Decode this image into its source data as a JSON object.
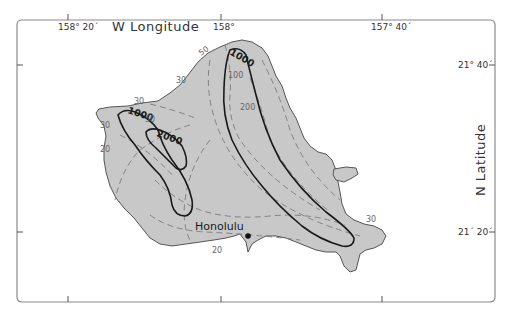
{
  "map": {
    "title_axis_top": "W  Longitude",
    "title_axis_right": "N  Latitude",
    "colors": {
      "land": "#c8c8c8",
      "coastline": "#555555",
      "frame": "#8a8a8a",
      "major_contour": "#1a1a1a",
      "minor_contour": "#7a7a7a"
    },
    "longitude_ticks": [
      {
        "label": "158° 20´"
      },
      {
        "label": "158°"
      },
      {
        "label": "157° 40´"
      }
    ],
    "latitude_ticks": [
      {
        "label": "21° 40´"
      },
      {
        "label": "21´ 20´"
      }
    ],
    "places": [
      {
        "name": "Honolulu"
      }
    ],
    "contour_labels": {
      "major": [
        "1000",
        "2000",
        "1000"
      ],
      "minor": [
        "50",
        "30",
        "100",
        "200",
        "30",
        "50",
        "30",
        "20",
        "30",
        "20"
      ]
    }
  }
}
